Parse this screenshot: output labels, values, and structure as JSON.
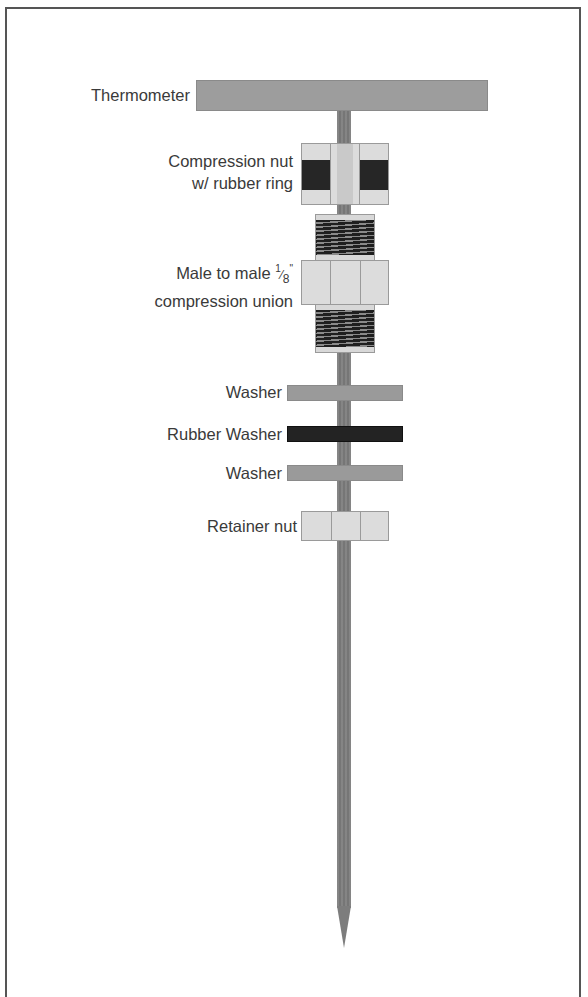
{
  "diagram": {
    "components": [
      {
        "id": "thermometer",
        "label": "Thermometer"
      },
      {
        "id": "compression-nut",
        "label_line1": "Compression nut",
        "label_line2": "w/ rubber ring"
      },
      {
        "id": "compression-union",
        "label_line1_prefix": "Male to male ",
        "fraction_num": "1",
        "fraction_den": "8",
        "inch_mark": "\"",
        "label_line2": "compression union"
      },
      {
        "id": "washer-1",
        "label": "Washer"
      },
      {
        "id": "rubber-washer",
        "label": "Rubber Washer"
      },
      {
        "id": "washer-2",
        "label": "Washer"
      },
      {
        "id": "retainer-nut",
        "label": "Retainer nut"
      }
    ],
    "colors": {
      "metal_gray": "#9d9d9d",
      "rod_gray": "#7d7d7d",
      "nut_light": "#dcdcdc",
      "rubber_black": "#232323",
      "text": "#3a3a3a",
      "frame": "#555555"
    }
  }
}
